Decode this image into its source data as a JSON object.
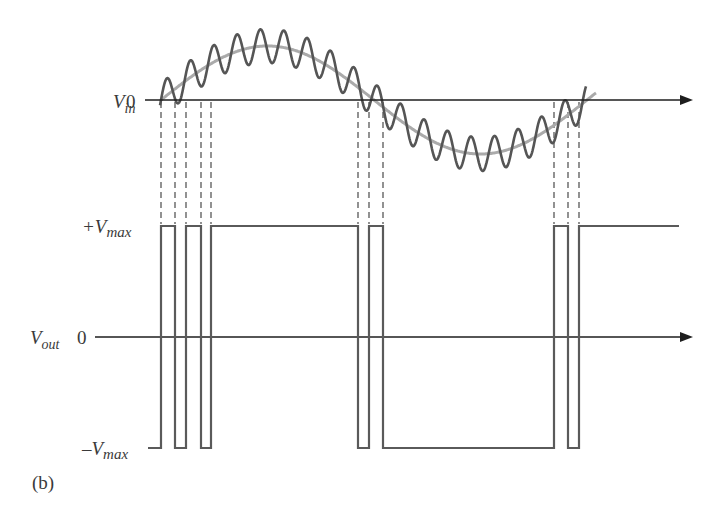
{
  "figure": {
    "panel_label": "(b)",
    "vin_label": {
      "main": "V",
      "sub": "in"
    },
    "vout_label": {
      "main": "V",
      "sub": "out"
    },
    "vin_zero": "0",
    "vout_zero": "0",
    "pos_max": {
      "main": "+V",
      "sub": "max"
    },
    "neg_max": {
      "main": "–V",
      "sub": "max"
    }
  },
  "colors": {
    "axis": "#1e1e1e",
    "noisy_wave": "#555555",
    "clean_sine": "#aaaaaa",
    "square_wave": "#5a5a5a",
    "dashed_guides": "#4a4a4a"
  },
  "geometry": {
    "vin_axis_y": 100,
    "vout_axis_y": 337,
    "axis_x_start_vin": 145,
    "axis_x_start_vout": 95,
    "axis_x_end": 693,
    "pos_max_y": 226,
    "neg_max_y": 448,
    "sine": {
      "x_zero1": 161,
      "x_zero2": 374,
      "amplitude": 54,
      "x_end": 596
    },
    "noise": {
      "amplitude": 17,
      "period": 23.4,
      "phase": 0
    },
    "transitions_x": [
      161,
      175,
      186,
      201,
      211,
      358,
      369,
      383,
      554,
      568,
      579
    ],
    "output_start_x": 148,
    "output_end_x": 679,
    "initial_state": "low"
  },
  "chart_data": {
    "type": "line",
    "series": [
      {
        "name": "V_in (noisy)",
        "description": "sine wave with superimposed high-frequency noise"
      },
      {
        "name": "V_in (clean sine)",
        "description": "underlying low-frequency sine, light gray"
      },
      {
        "name": "V_out",
        "description": "square wave switching between +Vmax and -Vmax at each zero crossing of noisy V_in"
      }
    ],
    "levels": [
      "+Vmax",
      "0",
      "-Vmax"
    ],
    "zero_crossings_count": 11,
    "output_sequence": [
      "-Vmax",
      "+Vmax",
      "-Vmax",
      "+Vmax",
      "-Vmax",
      "+Vmax",
      "-Vmax",
      "+Vmax",
      "-Vmax",
      "+Vmax",
      "-Vmax",
      "+Vmax"
    ]
  }
}
